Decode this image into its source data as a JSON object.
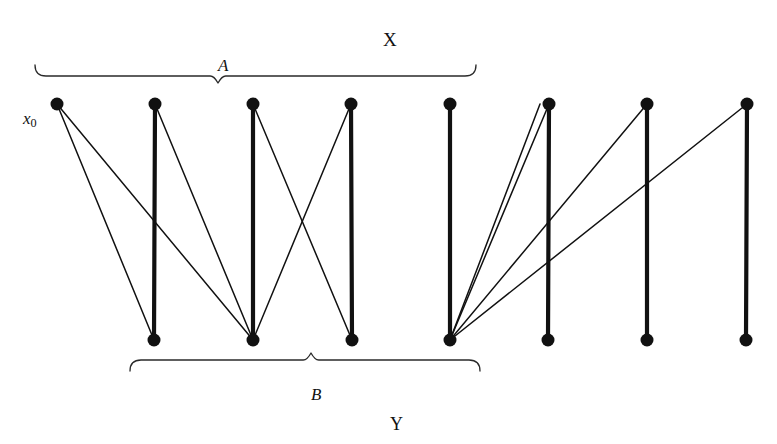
{
  "figure": {
    "type": "bipartite-graph-diagram",
    "width": 777,
    "height": 444,
    "background": "#ffffff",
    "ink_color": "#111111"
  },
  "labels": {
    "set_x": "X",
    "set_y": "Y",
    "subset_a": "A",
    "subset_b": "B",
    "x_zero_base": "x",
    "x_zero_sub": "0"
  },
  "label_positions": {
    "set_x": {
      "x": 383,
      "y": 30,
      "size": 19
    },
    "set_y": {
      "x": 390,
      "y": 415,
      "size": 18
    },
    "subset_a": {
      "x": 218,
      "y": 57,
      "size": 17
    },
    "subset_b": {
      "x": 311,
      "y": 386,
      "size": 17
    },
    "x_zero": {
      "x": 23,
      "y": 110,
      "size": 17
    }
  },
  "nodes": {
    "radius": 6.5,
    "color": "#111111",
    "top_row": {
      "y": 104,
      "label": "X",
      "points": [
        {
          "id": "x0",
          "x": 57,
          "in_subset": "A"
        },
        {
          "id": "x1",
          "x": 155,
          "in_subset": "A"
        },
        {
          "id": "x2",
          "x": 253,
          "in_subset": "A"
        },
        {
          "id": "x3",
          "x": 351,
          "in_subset": "A"
        },
        {
          "id": "x4",
          "x": 450,
          "in_subset": "A"
        },
        {
          "id": "x5",
          "x": 549,
          "in_subset": ""
        },
        {
          "id": "x6",
          "x": 647,
          "in_subset": ""
        },
        {
          "id": "x7",
          "x": 747,
          "in_subset": ""
        }
      ]
    },
    "bottom_row": {
      "y": 340,
      "label": "Y",
      "points": [
        {
          "id": "y0",
          "x": 154,
          "in_subset": "B"
        },
        {
          "id": "y1",
          "x": 253,
          "in_subset": "B"
        },
        {
          "id": "y2",
          "x": 352,
          "in_subset": "B"
        },
        {
          "id": "y3",
          "x": 450,
          "in_subset": "B"
        },
        {
          "id": "y4",
          "x": 548,
          "in_subset": ""
        },
        {
          "id": "y5",
          "x": 647,
          "in_subset": ""
        },
        {
          "id": "y6",
          "x": 746,
          "in_subset": ""
        }
      ]
    }
  },
  "edges": {
    "thick_width": 4.2,
    "thin_width": 1.5,
    "list": [
      {
        "from": "x0",
        "to": "y0",
        "weight": "thin"
      },
      {
        "from": "x0",
        "to": "y1",
        "weight": "thin"
      },
      {
        "from": "x1",
        "to": "y0",
        "weight": "thick"
      },
      {
        "from": "x1",
        "to": "y1",
        "weight": "thin"
      },
      {
        "from": "x2",
        "to": "y1",
        "weight": "thick"
      },
      {
        "from": "x2",
        "to": "y2",
        "weight": "thin"
      },
      {
        "from": "x3",
        "to": "y1",
        "weight": "thin"
      },
      {
        "from": "x3",
        "to": "y2",
        "weight": "thick"
      },
      {
        "from": "x4",
        "to": "y3",
        "weight": "thick"
      },
      {
        "from": "x5",
        "to": "y3",
        "weight": "thin"
      },
      {
        "from": "x5",
        "to": "y3b",
        "weight": "thin"
      },
      {
        "from": "x5",
        "to": "y4",
        "weight": "thick"
      },
      {
        "from": "x6",
        "to": "y3",
        "weight": "thin"
      },
      {
        "from": "x6",
        "to": "y5",
        "weight": "thick"
      },
      {
        "from": "x7",
        "to": "y3",
        "weight": "thin"
      },
      {
        "from": "x7",
        "to": "y6",
        "weight": "thick"
      }
    ]
  },
  "braces": {
    "stroke": "#2a2a2a",
    "width": 1.3,
    "a_brace": {
      "left": 35,
      "right": 476,
      "y": 76,
      "tip_x": 218,
      "drop": 9,
      "label": "A"
    },
    "b_brace": {
      "left": 130,
      "right": 480,
      "y": 360,
      "tip_x": 311,
      "drop": 9,
      "label": "B"
    }
  }
}
